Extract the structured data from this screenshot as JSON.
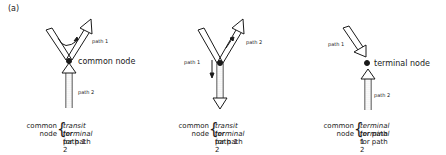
{
  "figure_label": "(a)",
  "colors": {
    "ink": "#1a1a1a",
    "background": "#ffffff"
  },
  "panels": [
    {
      "id": "left",
      "path1_label": "path 1",
      "path2_label": "path 2",
      "node_label": "common node",
      "caption": {
        "left_line1": "common",
        "left_line2": "node",
        "right_line1_italic": "transit",
        "right_line1_rest": " for path 1",
        "right_line2_italic": "terminal",
        "right_line2_rest": " for path 2"
      }
    },
    {
      "id": "middle",
      "path1_label": "path 1",
      "path2_label": "path 2",
      "caption": {
        "left_line1": "common",
        "left_line2": "node",
        "right_line1_italic": "transit",
        "right_line1_rest": " for path 1",
        "right_line2_italic": "terminal",
        "right_line2_rest": " for path 2"
      }
    },
    {
      "id": "right",
      "path1_label": "path 1",
      "path2_label": "path 2",
      "node_label": "terminal node",
      "caption": {
        "left_line1": "common",
        "left_line2": "node",
        "right_line1_italic": "terminal",
        "right_line1_rest": " for path 1",
        "right_line2_italic": "terminal",
        "right_line2_rest": " for path 2"
      }
    }
  ]
}
